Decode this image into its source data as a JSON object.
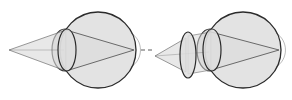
{
  "figure": {
    "title": "Eye refraction diagram: uncorrected eye and eye with corrective lens",
    "background_color": "#ffffff",
    "width": 292,
    "height": 100,
    "panel_count": 2
  },
  "style": {
    "globe_fill": "#e3e3e3",
    "globe_stroke": "#2b2b2b",
    "globe_stroke_width": 1.3,
    "cone_fill": "#d9d9d9",
    "cone_fill_opacity": 0.55,
    "ray_stroke": "#4a4a4a",
    "ray_stroke_width": 0.8,
    "lens_fill": "#dedede",
    "lens_stroke": "#2b2b2b",
    "lens_stroke_width": 1.2,
    "cornea_stroke": "#3a3a3a",
    "divider_stroke": "#6a6a6a",
    "divider_stroke_width": 1.1
  },
  "panels": [
    {
      "id": "panel-left",
      "name": "uncorrected-eye",
      "label": "",
      "globe": {
        "cx": 98,
        "cy": 50,
        "rx": 38,
        "ry": 38
      },
      "cornea": {
        "cx": 65,
        "cy": 50,
        "rx": 13,
        "ry": 21
      },
      "crystalline_lens": {
        "cx": 67,
        "cy": 50,
        "rx": 9,
        "ry": 21
      },
      "light_source": {
        "x": 9,
        "y": 50
      },
      "focus_point": {
        "x": 134,
        "y": 50
      },
      "rays": [
        {
          "from": [
            9,
            50
          ],
          "to": [
            134,
            51
          ]
        },
        {
          "from": [
            9,
            50
          ],
          "to": [
            133,
            49
          ]
        }
      ],
      "cone": {
        "apex": [
          9,
          50
        ],
        "top": [
          66,
          30
        ],
        "bottom": [
          66,
          71
        ]
      },
      "external_lens": null
    },
    {
      "id": "panel-right",
      "name": "corrected-eye",
      "label": "",
      "globe": {
        "cx": 243,
        "cy": 50,
        "rx": 38,
        "ry": 38
      },
      "cornea": {
        "cx": 210,
        "cy": 50,
        "rx": 13,
        "ry": 21
      },
      "crystalline_lens": {
        "cx": 212,
        "cy": 50,
        "rx": 9,
        "ry": 21
      },
      "light_source": {
        "x": 155,
        "y": 56
      },
      "focus_point": {
        "x": 279,
        "y": 50
      },
      "rays": [
        {
          "from": [
            155,
            56
          ],
          "to": [
            279,
            51
          ]
        },
        {
          "from": [
            155,
            56
          ],
          "to": [
            278,
            49
          ]
        }
      ],
      "cone": {
        "apex": [
          155,
          56
        ],
        "top": [
          186,
          38
        ],
        "bottom": [
          186,
          72
        ]
      },
      "external_lens": {
        "cx": 188,
        "cy": 55,
        "rx": 8,
        "ry": 23
      }
    }
  ],
  "divider": {
    "name": "dashed-divider",
    "y": 50,
    "dashes": [
      {
        "x1": 141,
        "x2": 145
      },
      {
        "x1": 148,
        "x2": 152
      }
    ]
  }
}
